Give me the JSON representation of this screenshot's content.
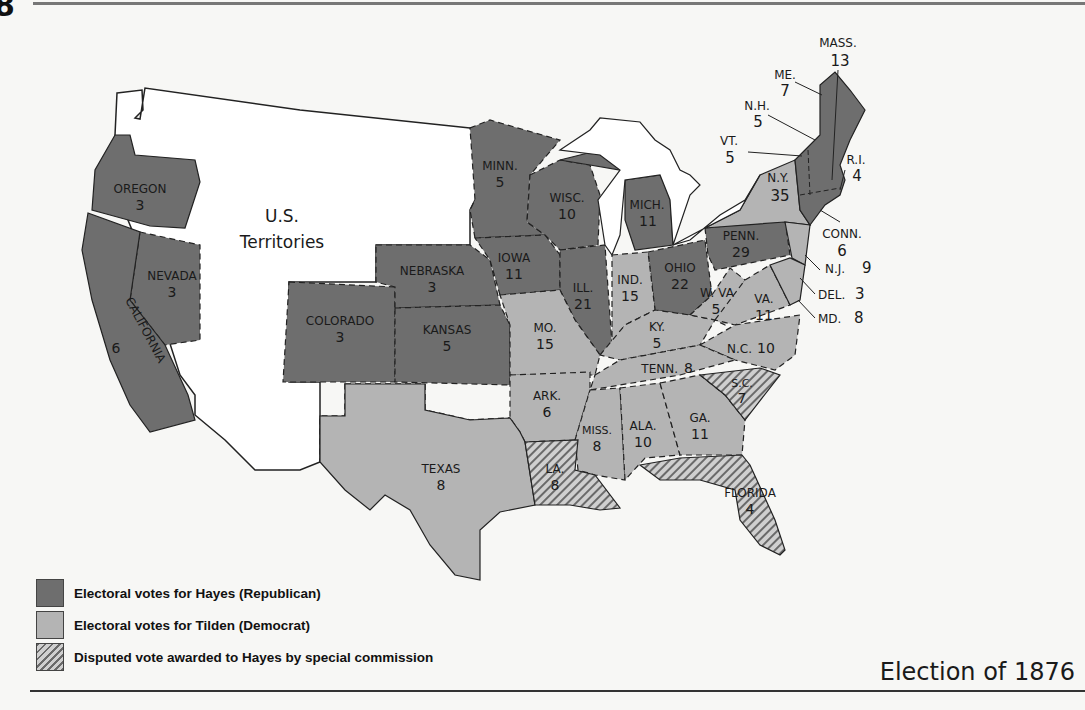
{
  "page": {
    "corner_number": "8",
    "title": "Election of 1876"
  },
  "colors": {
    "hayes": "#6e6e6e",
    "tilden": "#b4b4b4",
    "disputed_stripe": "#6a6a6a",
    "territories": "#ffffff",
    "water": "#ffffff"
  },
  "legend": {
    "items": [
      {
        "key": "hayes",
        "label": "Electoral votes for Hayes (Republican)"
      },
      {
        "key": "tilden",
        "label": "Electoral votes for Tilden (Democrat)"
      },
      {
        "key": "disputed",
        "label": "Disputed vote awarded to Hayes by special commission"
      }
    ]
  },
  "territories_label": {
    "line1": "U.S.",
    "line2": "Territories"
  },
  "states": {
    "oregon": {
      "name": "OREGON",
      "votes": "3",
      "party": "hayes"
    },
    "california": {
      "name": "CALIFORNIA",
      "votes": "6",
      "party": "hayes"
    },
    "nevada": {
      "name": "NEVADA",
      "votes": "3",
      "party": "hayes"
    },
    "colorado": {
      "name": "COLORADO",
      "votes": "3",
      "party": "hayes"
    },
    "nebraska": {
      "name": "NEBRASKA",
      "votes": "3",
      "party": "hayes"
    },
    "kansas": {
      "name": "KANSAS",
      "votes": "5",
      "party": "hayes"
    },
    "minnesota": {
      "name": "MINN.",
      "votes": "5",
      "party": "hayes"
    },
    "iowa": {
      "name": "IOWA",
      "votes": "11",
      "party": "hayes"
    },
    "wisconsin": {
      "name": "WISC.",
      "votes": "10",
      "party": "hayes"
    },
    "illinois": {
      "name": "ILL.",
      "votes": "21",
      "party": "hayes"
    },
    "michigan": {
      "name": "MICH.",
      "votes": "11",
      "party": "hayes"
    },
    "indiana": {
      "name": "IND.",
      "votes": "15",
      "party": "tilden"
    },
    "ohio": {
      "name": "OHIO",
      "votes": "22",
      "party": "hayes"
    },
    "pennsylvania": {
      "name": "PENN.",
      "votes": "29",
      "party": "hayes"
    },
    "new_york": {
      "name": "N.Y.",
      "votes": "35",
      "party": "tilden"
    },
    "vermont": {
      "name": "VT.",
      "votes": "5",
      "party": "hayes"
    },
    "new_hampshire": {
      "name": "N.H.",
      "votes": "5",
      "party": "hayes"
    },
    "maine": {
      "name": "ME.",
      "votes": "7",
      "party": "hayes"
    },
    "massachusetts": {
      "name": "MASS.",
      "votes": "13",
      "party": "hayes"
    },
    "rhode_island": {
      "name": "R.I.",
      "votes": "4",
      "party": "hayes"
    },
    "connecticut": {
      "name": "CONN.",
      "votes": "6",
      "party": "tilden"
    },
    "new_jersey": {
      "name": "N.J.",
      "votes": "9",
      "party": "tilden"
    },
    "delaware": {
      "name": "DEL.",
      "votes": "3",
      "party": "tilden"
    },
    "maryland": {
      "name": "MD.",
      "votes": "8",
      "party": "tilden"
    },
    "west_virginia": {
      "name": "W. VA",
      "votes": "5",
      "party": "tilden"
    },
    "virginia": {
      "name": "VA.",
      "votes": "11",
      "party": "tilden"
    },
    "kentucky": {
      "name": "KY.",
      "votes": "5",
      "party": "tilden"
    },
    "missouri": {
      "name": "MO.",
      "votes": "15",
      "party": "tilden"
    },
    "north_carolina": {
      "name": "N.C.",
      "votes": "10",
      "party": "tilden"
    },
    "tennessee": {
      "name": "TENN.",
      "votes": "8",
      "party": "tilden"
    },
    "south_carolina": {
      "name": "S.C.",
      "votes": "7",
      "party": "disputed"
    },
    "arkansas": {
      "name": "ARK.",
      "votes": "6",
      "party": "tilden"
    },
    "mississippi": {
      "name": "MISS.",
      "votes": "8",
      "party": "tilden"
    },
    "alabama": {
      "name": "ALA.",
      "votes": "10",
      "party": "tilden"
    },
    "georgia": {
      "name": "GA.",
      "votes": "11",
      "party": "tilden"
    },
    "texas": {
      "name": "TEXAS",
      "votes": "8",
      "party": "tilden"
    },
    "louisiana": {
      "name": "LA.",
      "votes": "8",
      "party": "disputed"
    },
    "florida": {
      "name": "FLORIDA",
      "votes": "4",
      "party": "disputed"
    }
  }
}
